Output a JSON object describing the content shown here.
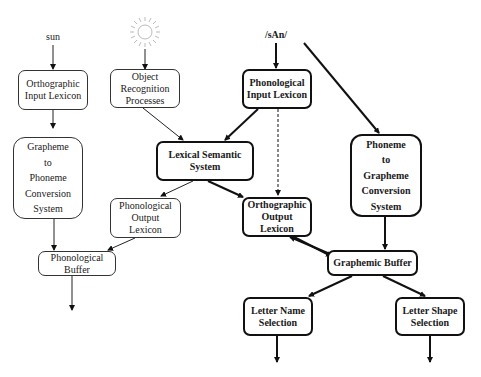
{
  "inputs": {
    "written_word": "sun",
    "picture_icon": "sun-picture-icon",
    "spoken_word": "/sAn/"
  },
  "boxes": {
    "orthographic_input_lexicon": "Orthographic\nInput Lexicon",
    "object_recognition": "Object\nRecognition\nProcesses",
    "phonological_input_lexicon": "Phonological\nInput Lexicon",
    "grapheme_to_phoneme": "Grapheme\nto\nPhoneme\nConversion\nSystem",
    "lexical_semantic_system": "Lexical Semantic\nSystem",
    "phoneme_to_grapheme": "Phoneme\nto\nGrapheme\nConversion\nSystem",
    "phonological_output_lexicon": "Phonological\nOutput\nLexicon",
    "orthographic_output_lexicon": "Orthographic\nOutput\nLexicon",
    "phonological_buffer": "Phonological Buffer",
    "graphemic_buffer": "Graphemic Buffer",
    "letter_name_selection": "Letter Name\nSelection",
    "letter_shape_selection": "Letter Shape\nSelection"
  },
  "colors": {
    "line": "#1a1a1a",
    "thin_line": "#333333",
    "sun_rays": "#b0b0b0"
  }
}
